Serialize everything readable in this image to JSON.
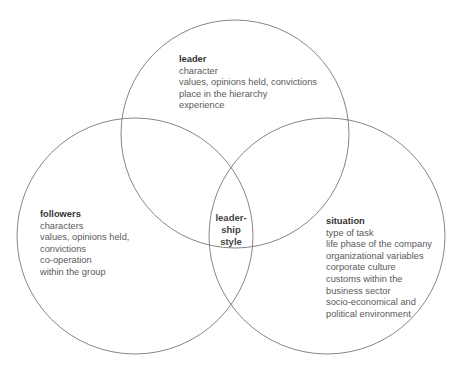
{
  "diagram": {
    "type": "venn",
    "circles": [
      {
        "id": "leader",
        "cx": 235,
        "cy": 134,
        "r": 114
      },
      {
        "id": "followers",
        "cx": 135,
        "cy": 236,
        "r": 118
      },
      {
        "id": "situation",
        "cx": 327,
        "cy": 236,
        "r": 118
      }
    ],
    "stroke_color": "#777777"
  },
  "leader": {
    "title": "leader",
    "lines": [
      "character",
      "values, opinions held, convictions",
      "place in the hierarchy",
      "experience"
    ]
  },
  "followers": {
    "title": "followers",
    "lines": [
      "characters",
      "values, opinions held,",
      "convictions",
      "co-operation",
      "within the group"
    ]
  },
  "situation": {
    "title": "situation",
    "lines": [
      "type of task",
      "life phase of the company",
      "organizational variables",
      "corporate culture",
      "customs within the",
      "business sector",
      "socio-economical and",
      "political environment"
    ]
  },
  "center": {
    "lines": [
      "leader-",
      "ship",
      "style"
    ]
  }
}
